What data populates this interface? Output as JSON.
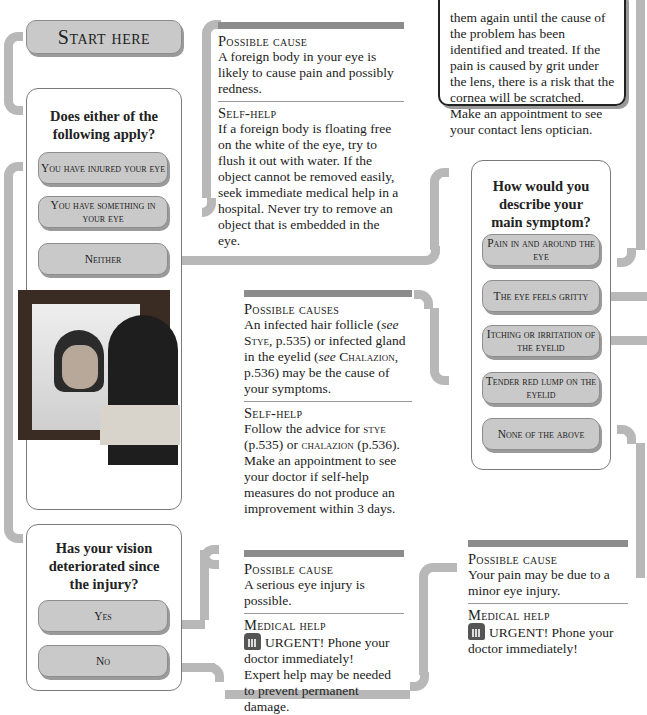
{
  "start": {
    "label": "Start here"
  },
  "question1": {
    "title": "Does either of the following apply?",
    "options": [
      "You have injured your eye",
      "You have something in your eye",
      "Neither"
    ]
  },
  "question2": {
    "title": "How would you describe your main symptom?",
    "options": [
      "Pain in and around the eye",
      "The eye feels gritty",
      "Itching or irritation of the eyelid",
      "Tender red lump on the eyelid",
      "None of the above"
    ]
  },
  "question3": {
    "title": "Has your vision deteriorated since the injury?",
    "options": [
      "Yes",
      "No"
    ]
  },
  "contact_lens_note": {
    "text": "them again until the cause of the problem has been identified and treated. If the pain is caused by grit under the lens, there is a risk that the cornea will be scratched. Make an appointment to see your contact lens optician."
  },
  "info_foreign_body": {
    "heading1": "Possible cause",
    "text1": "A foreign body in your eye is likely to cause pain and possibly redness.",
    "heading2": "Self-help",
    "text2": "If a foreign body is floating free on the white of the eye, try to flush it out with water. If the object cannot be removed easily, seek immediate medical help in a hospital. Never try to remove an object that is embedded in the eye."
  },
  "info_stye": {
    "heading1": "Possible causes",
    "text1a": "An infected hair follicle (",
    "see": "see",
    "stye": "Stye",
    "text1b": ", p.535) or infected gland in the eyelid (",
    "chalazion": "Chalazion",
    "text1c": ", p.536) may be the cause of your symptoms.",
    "heading2": "Self-help",
    "text2a": "Follow the advice for ",
    "stye2": "stye",
    "text2b": " (p.535) or ",
    "chalazion2": "chalazion",
    "text2c": " (p.536). Make an appointment to see your doctor if self-help measures do not produce an improvement within 3 days."
  },
  "info_serious_injury": {
    "heading1": "Possible cause",
    "text1": "A serious eye injury is possible.",
    "heading2": "Medical help",
    "urgent": "URGENT! Phone your doctor immediately!",
    "text2": "Expert help may be needed to prevent permanent damage."
  },
  "info_minor_injury": {
    "heading1": "Possible cause",
    "text1": "Your pain may be due to a minor eye injury.",
    "heading2": "Medical help",
    "urgent": "URGENT! Phone your doctor immediately!"
  },
  "colors": {
    "connector": "#b8b8b8",
    "option_fill": "#c9c9c9",
    "bar": "#8c8c8c"
  }
}
